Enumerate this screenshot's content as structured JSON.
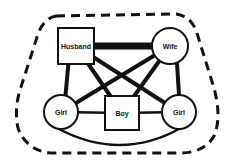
{
  "diagram": {
    "type": "family-system",
    "colors": {
      "ink": "#111111",
      "background": "#ffffff"
    },
    "boundary": {
      "style": "dashed",
      "label": ""
    },
    "nodes": [
      {
        "id": "husband",
        "label": "Husband",
        "shape": "square"
      },
      {
        "id": "wife",
        "label": "Wife",
        "shape": "circle"
      },
      {
        "id": "girl_left",
        "label": "Girl",
        "shape": "circle"
      },
      {
        "id": "boy",
        "label": "Boy",
        "shape": "square"
      },
      {
        "id": "girl_right",
        "label": "Girl",
        "shape": "circle"
      }
    ],
    "edges": [
      {
        "from": "husband",
        "to": "wife",
        "strength": "strongest"
      },
      {
        "from": "husband",
        "to": "girl_left",
        "strength": "strong"
      },
      {
        "from": "husband",
        "to": "boy",
        "strength": "strong"
      },
      {
        "from": "husband",
        "to": "girl_right",
        "strength": "strong"
      },
      {
        "from": "wife",
        "to": "girl_left",
        "strength": "strong"
      },
      {
        "from": "wife",
        "to": "boy",
        "strength": "strong"
      },
      {
        "from": "wife",
        "to": "girl_right",
        "strength": "strong"
      },
      {
        "from": "girl_left",
        "to": "boy",
        "strength": "medium"
      },
      {
        "from": "boy",
        "to": "girl_right",
        "strength": "medium"
      },
      {
        "from": "girl_left",
        "to": "girl_right",
        "strength": "medium",
        "curve": "arc-below"
      }
    ]
  }
}
